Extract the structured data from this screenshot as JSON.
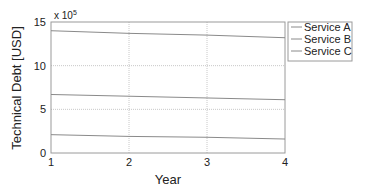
{
  "chart_data": {
    "type": "line",
    "title": "",
    "xlabel": "Year",
    "ylabel": "Technical Debt [USD]",
    "y_multiplier_label": "x 10",
    "y_multiplier_exponent": "5",
    "x": [
      1,
      2,
      3,
      4
    ],
    "xlim": [
      1,
      4
    ],
    "ylim": [
      0,
      15
    ],
    "x_ticks": [
      "1",
      "2",
      "3",
      "4"
    ],
    "y_ticks": [
      "0",
      "5",
      "10",
      "15"
    ],
    "grid": true,
    "legend_position": "outside-right-top",
    "series": [
      {
        "name": "Service A",
        "values": [
          14.0,
          13.7,
          13.5,
          13.2
        ],
        "color": "#8a8a8a"
      },
      {
        "name": "Service B",
        "values": [
          6.7,
          6.5,
          6.3,
          6.1
        ],
        "color": "#8a8a8a"
      },
      {
        "name": "Service C",
        "values": [
          2.1,
          1.9,
          1.8,
          1.6
        ],
        "color": "#8a8a8a"
      }
    ]
  }
}
